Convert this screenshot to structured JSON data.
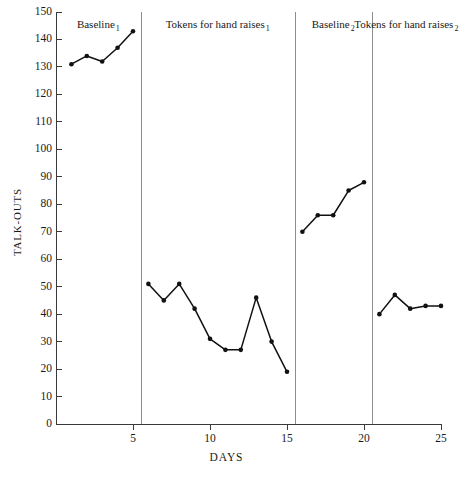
{
  "chart_data": {
    "type": "line",
    "title": "",
    "xlabel": "DAYS",
    "ylabel": "TALK-OUTS",
    "xlim": [
      0,
      25
    ],
    "ylim": [
      0,
      150
    ],
    "grid": false,
    "legend": "none",
    "x_ticks": [
      5,
      10,
      15,
      20,
      25
    ],
    "y_ticks": [
      0,
      10,
      20,
      30,
      40,
      50,
      60,
      70,
      80,
      90,
      100,
      110,
      120,
      130,
      140,
      150
    ],
    "phase_dividers": [
      5.5,
      15.5,
      20.5
    ],
    "series": [
      {
        "name": "Baseline 1",
        "x": [
          1,
          2,
          3,
          4,
          5
        ],
        "values": [
          131,
          134,
          132,
          137,
          143
        ]
      },
      {
        "name": "Tokens for hand raises 1",
        "x": [
          6,
          7,
          8,
          9,
          10,
          11,
          12,
          13,
          14,
          15
        ],
        "values": [
          51,
          45,
          51,
          42,
          31,
          27,
          27,
          46,
          30,
          19
        ]
      },
      {
        "name": "Baseline 2",
        "x": [
          16,
          17,
          18,
          19,
          20
        ],
        "values": [
          70,
          76,
          76,
          85,
          88
        ]
      },
      {
        "name": "Tokens for hand raises 2",
        "x": [
          21,
          22,
          23,
          24,
          25
        ],
        "values": [
          40,
          47,
          42,
          43,
          43
        ]
      }
    ]
  },
  "phases": [
    {
      "label": "Baseline",
      "subscript": "1"
    },
    {
      "label": "Tokens for hand raises",
      "subscript": "1"
    },
    {
      "label": "Baseline",
      "subscript": "2"
    },
    {
      "label": "Tokens for hand raises",
      "subscript": "2"
    }
  ],
  "colors": {
    "line": "#111111",
    "axis": "#3a3a3a",
    "divider": "#8d8d8d",
    "background": "#ffffff"
  }
}
